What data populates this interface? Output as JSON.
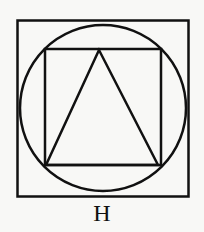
{
  "figure": {
    "label": "H",
    "stroke_color": "#111111",
    "background": "#f8f8f6",
    "shapes": [
      {
        "type": "outer-square",
        "x": 17,
        "y": 20,
        "w": 172,
        "h": 176
      },
      {
        "type": "circle",
        "cx": 103,
        "cy": 108,
        "r": 83
      },
      {
        "type": "inner-square",
        "x": 45,
        "y": 49,
        "w": 116,
        "h": 116
      },
      {
        "type": "triangle",
        "points": "99,50 46,165 158,165"
      }
    ]
  }
}
